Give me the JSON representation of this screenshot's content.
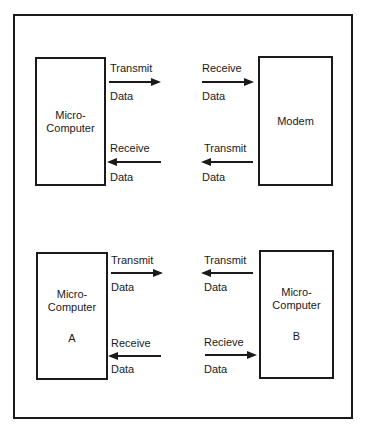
{
  "top_section": {
    "left_box": {
      "line1": "Micro-",
      "line2": "Computer"
    },
    "right_box": {
      "label": "Modem"
    },
    "arrows": [
      {
        "direction": "right",
        "label_top": "Transmit",
        "label_bottom": "Data"
      },
      {
        "direction": "right",
        "label_top": "Receive",
        "label_bottom": "Data"
      },
      {
        "direction": "left",
        "label_top": "Receive",
        "label_bottom": "Data"
      },
      {
        "direction": "left",
        "label_top": "Transmit",
        "label_bottom": "Data"
      }
    ]
  },
  "bottom_section": {
    "left_box": {
      "line1": "Micro-",
      "line2": "Computer",
      "id": "A"
    },
    "right_box": {
      "line1": "Micro-",
      "line2": "Computer",
      "id": "B"
    },
    "arrows": [
      {
        "direction": "right",
        "label_top": "Transmit",
        "label_bottom": "Data"
      },
      {
        "direction": "left",
        "label_top": "Transmit",
        "label_bottom": "Data"
      },
      {
        "direction": "left",
        "label_top": "Receive",
        "label_bottom": "Data"
      },
      {
        "direction": "right",
        "label_top": "Recieve",
        "label_bottom": "Data"
      }
    ]
  }
}
